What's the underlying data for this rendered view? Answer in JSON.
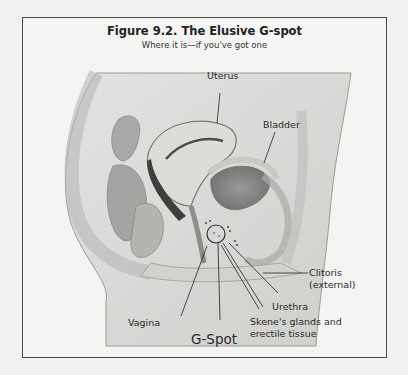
{
  "figure": {
    "title": "Figure 9.2. The Elusive G-spot",
    "subtitle": "Where it is—if you've got one"
  },
  "labels": {
    "uterus": "Uterus",
    "bladder": "Bladder",
    "clitoris_line1": "Clitoris",
    "clitoris_line2": "(external)",
    "urethra": "Urethra",
    "skenes_line1": "Skene's glands and",
    "skenes_line2": "erectile tissue",
    "vagina": "Vagina",
    "gspot": "G-Spot"
  },
  "colors": {
    "frame": "#4a4a4a",
    "background": "#f4f4f2",
    "label_text": "#2a2a2a"
  }
}
